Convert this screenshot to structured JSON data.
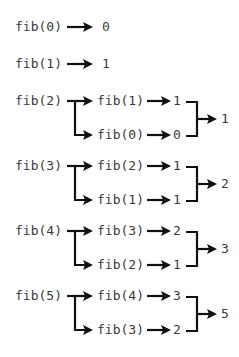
{
  "diagram": {
    "colors": {
      "text": "#3a3a3a",
      "arrow": "#111111",
      "background": "#ffffff"
    },
    "base_cases": [
      {
        "call": "fib(0)",
        "result": "0"
      },
      {
        "call": "fib(1)",
        "result": "1"
      }
    ],
    "recursive_cases": [
      {
        "call": "fib(2)",
        "left_call": "fib(1)",
        "left_value": "1",
        "right_call": "fib(0)",
        "right_value": "0",
        "result": "1"
      },
      {
        "call": "fib(3)",
        "left_call": "fib(2)",
        "left_value": "1",
        "right_call": "fib(1)",
        "right_value": "1",
        "result": "2"
      },
      {
        "call": "fib(4)",
        "left_call": "fib(3)",
        "left_value": "2",
        "right_call": "fib(2)",
        "right_value": "1",
        "result": "3"
      },
      {
        "call": "fib(5)",
        "left_call": "fib(4)",
        "left_value": "3",
        "right_call": "fib(3)",
        "right_value": "2",
        "result": "5"
      }
    ]
  }
}
